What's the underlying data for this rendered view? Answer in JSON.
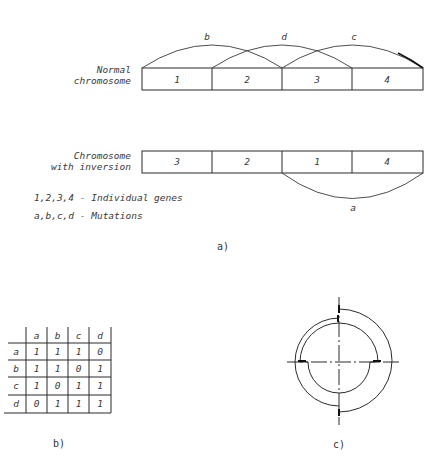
{
  "panel_a": {
    "normal_label_line1": "Normal",
    "normal_label_line2": "chromosome",
    "normal_genes": [
      "1",
      "2",
      "3",
      "4"
    ],
    "normal_arcs": [
      "b",
      "d",
      "c"
    ],
    "inverted_label_line1": "Chromosome",
    "inverted_label_line2": "with inversion",
    "inverted_genes": [
      "3",
      "2",
      "1",
      "4"
    ],
    "inverted_arc": "a",
    "legend_line1": "1,2,3,4 - Individual genes",
    "legend_line2": "a,b,c,d - Mutations",
    "caption": "a)"
  },
  "panel_b": {
    "columns": [
      "a",
      "b",
      "c",
      "d"
    ],
    "rows": [
      {
        "label": "a",
        "values": [
          "1",
          "1",
          "1",
          "0"
        ]
      },
      {
        "label": "b",
        "values": [
          "1",
          "1",
          "0",
          "1"
        ]
      },
      {
        "label": "c",
        "values": [
          "1",
          "0",
          "1",
          "1"
        ]
      },
      {
        "label": "d",
        "values": [
          "0",
          "1",
          "1",
          "1"
        ]
      }
    ],
    "caption": "b)"
  },
  "panel_c": {
    "caption": "c)"
  }
}
